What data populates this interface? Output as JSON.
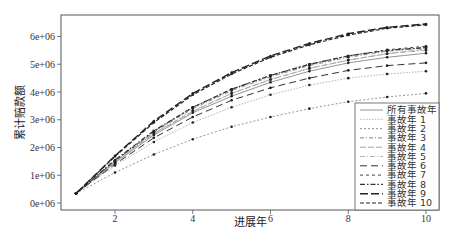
{
  "chart_data": {
    "type": "line",
    "title": "",
    "xlabel": "进展年",
    "ylabel": "累计赔款额",
    "xlim": [
      0.7,
      10.5
    ],
    "ylim": [
      -0.1,
      6.8
    ],
    "y_scale_note": "values in units of 1e6",
    "x_ticks": [
      2,
      4,
      6,
      8,
      10
    ],
    "x_tick_labels": [
      "2",
      "4",
      "6",
      "8",
      "10"
    ],
    "y_ticks": [
      0,
      1,
      2,
      3,
      4,
      5,
      6
    ],
    "y_tick_labels": [
      "0e+06",
      "1e+06",
      "2e+06",
      "3e+06",
      "4e+06",
      "5e+06",
      "6e+06"
    ],
    "grid": false,
    "legend_position": "bottom-right",
    "x": [
      1,
      2,
      3,
      4,
      5,
      6,
      7,
      8,
      9,
      10
    ],
    "series": [
      {
        "name": "所有事故年",
        "style": "solid-thin",
        "values": [
          0.35,
          1.45,
          2.45,
          3.25,
          3.85,
          4.35,
          4.75,
          5.05,
          5.25,
          5.4
        ]
      },
      {
        "name": "事故年 1",
        "style": "dotted-light",
        "values": [
          0.35,
          1.35,
          2.2,
          2.9,
          3.45,
          3.9,
          4.25,
          4.5,
          4.65,
          4.75
        ]
      },
      {
        "name": "事故年 2",
        "style": "dotted",
        "values": [
          0.35,
          1.1,
          1.75,
          2.3,
          2.75,
          3.1,
          3.4,
          3.65,
          3.82,
          3.95
        ]
      },
      {
        "name": "事故年 3",
        "style": "dash-dot",
        "values": [
          0.35,
          1.5,
          2.55,
          3.4,
          4.05,
          4.55,
          4.95,
          5.25,
          5.47,
          5.6
        ]
      },
      {
        "name": "事故年 4",
        "style": "long-dash-light",
        "values": [
          0.35,
          1.5,
          2.5,
          3.3,
          3.95,
          4.45,
          4.85,
          5.15,
          5.38,
          5.55
        ]
      },
      {
        "name": "事故年 5",
        "style": "dash-dot-light",
        "values": [
          0.35,
          1.48,
          2.5,
          3.32,
          3.95,
          4.45,
          4.85,
          5.15,
          5.38,
          5.5
        ]
      },
      {
        "name": "事故年 6",
        "style": "long-dash",
        "values": [
          0.35,
          1.4,
          2.35,
          3.1,
          3.7,
          4.15,
          4.5,
          4.78,
          4.95,
          5.05
        ]
      },
      {
        "name": "事故年 7",
        "style": "short-dash",
        "values": [
          0.35,
          1.52,
          2.58,
          3.45,
          4.1,
          4.6,
          5.0,
          5.3,
          5.52,
          5.65
        ]
      },
      {
        "name": "事故年 8",
        "style": "dash-dot-heavy",
        "values": [
          0.35,
          1.55,
          2.6,
          3.45,
          4.1,
          4.6,
          5.0,
          5.3,
          5.5,
          5.6
        ]
      },
      {
        "name": "事故年 9",
        "style": "long-dash-heavy",
        "values": [
          0.35,
          1.7,
          2.95,
          3.95,
          4.7,
          5.3,
          5.75,
          6.1,
          6.33,
          6.45
        ]
      },
      {
        "name": "事故年 10",
        "style": "dash-medium",
        "values": [
          0.35,
          1.68,
          2.9,
          3.9,
          4.65,
          5.25,
          5.7,
          6.05,
          6.3,
          6.42
        ]
      }
    ]
  }
}
